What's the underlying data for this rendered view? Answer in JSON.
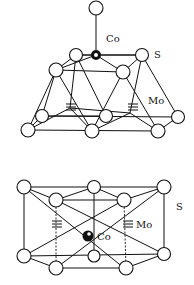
{
  "top_structure": {
    "labels": {
      "co": "Co",
      "s": "S",
      "mo": "Mo"
    }
  },
  "bottom_structure": {
    "labels": {
      "co": "Co",
      "s": "S",
      "mo": "Mo"
    }
  },
  "colors": {
    "line": "#111111",
    "background": "#ffffff"
  }
}
